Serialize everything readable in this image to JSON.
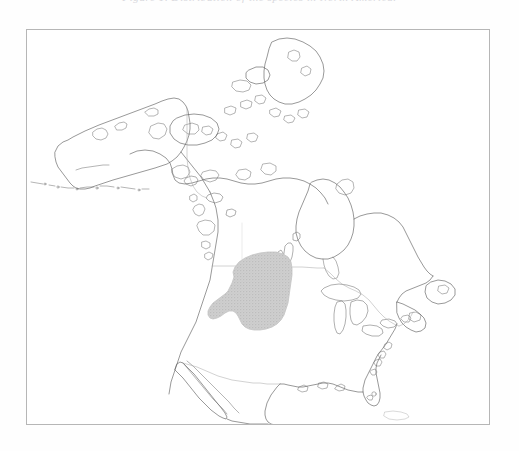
{
  "figure": {
    "caption_clipped": "Figure 1.  Distribution of the species in North America.",
    "type": "distribution-range-map",
    "region": "North America",
    "projection_note": "continental outline map"
  },
  "map": {
    "frame": {
      "x": 26,
      "y": 29,
      "width": 464,
      "height": 396,
      "border_color": "#b6b6b6",
      "background_color": "#ffffff"
    },
    "layers": [
      {
        "name": "coastline",
        "color": "#5a5a5a",
        "visible": true
      },
      {
        "name": "political-borders",
        "color": "#adadad",
        "visible": true
      },
      {
        "name": "lakes",
        "color": "#6e6e6e",
        "visible": true
      },
      {
        "name": "species-range",
        "color": "#c8c8c8",
        "visible": true
      }
    ],
    "features": [
      "Alaska",
      "Aleutian Islands",
      "Canadian Arctic Archipelago",
      "Baffin Island",
      "Hudson Bay",
      "Great Lakes",
      "Lake Winnipeg",
      "Newfoundland",
      "Labrador",
      "Nova Scotia",
      "Florida",
      "Baja California",
      "Gulf of Mexico",
      "Cuba"
    ]
  },
  "range": {
    "label": "Shaded distribution range",
    "fill_color": "#c8c8c8",
    "outline_color": "#c4c4c4",
    "pattern": "halftone-stipple",
    "extent_description": "Great Plains region spanning the northern United States into the southern Canadian prairies",
    "bounds_px": {
      "left": 205,
      "top": 236,
      "right": 300,
      "bottom": 320
    }
  },
  "colors": {
    "page_background": "#fefefe",
    "frame_border": "#b6b6b6",
    "coastline": "#5a5a5a",
    "political_border": "#adadad",
    "range_fill": "#c8c8c8",
    "caption_text": "#b9b9c2"
  }
}
